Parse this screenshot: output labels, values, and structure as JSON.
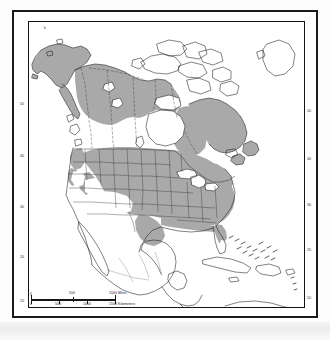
{
  "document": {
    "kind": "scanned-figure",
    "map_title": "",
    "region": "North America"
  },
  "map": {
    "projection_note": "",
    "background_color": "#ffffff",
    "shading_color": "#a9a9a9",
    "coastline_color": "#1a1a1a",
    "border_color": "#2a2a2a",
    "frame_color": "#141414"
  },
  "graticule": {
    "axis": "latitude",
    "unit": "degrees",
    "left_labels": [
      {
        "value": "50",
        "y": 105
      },
      {
        "value": "40",
        "y": 157
      },
      {
        "value": "30",
        "y": 208
      },
      {
        "value": "20",
        "y": 258
      },
      {
        "value": "10",
        "y": 302
      }
    ],
    "right_labels": [
      {
        "value": "50",
        "y": 112
      },
      {
        "value": "40",
        "y": 160
      },
      {
        "value": "30",
        "y": 206
      },
      {
        "value": "20",
        "y": 251
      },
      {
        "value": "10",
        "y": 299
      }
    ]
  },
  "scale_bar": {
    "miles": {
      "unit_label": "1000 Miles",
      "ticks": [
        "0",
        "500",
        "1000"
      ]
    },
    "kilometers": {
      "unit_label": "1500 Kilometers",
      "ticks": [
        "0",
        "500",
        "1000",
        "1500"
      ]
    }
  },
  "legend": {
    "shaded_meaning": "",
    "entries": []
  },
  "annotations": {
    "corner_mark": "b"
  }
}
